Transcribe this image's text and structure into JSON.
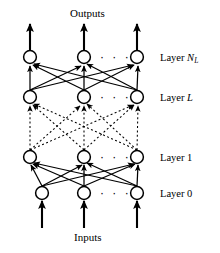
{
  "figure": {
    "title_top": "Outputs",
    "title_bottom": "Inputs",
    "ellipsis": "· · ·",
    "colors": {
      "ink": "#000000",
      "background": "#ffffff"
    }
  },
  "labels": {
    "layer_nl_prefix": "Layer ",
    "layer_nl_symbol": "N",
    "layer_nl_subscript": "L",
    "layer_l_prefix": "Layer ",
    "layer_l_symbol": "L",
    "layer_1": "Layer 1",
    "layer_0": "Layer 0"
  },
  "layers": [
    {
      "id": "layer-nl",
      "name": "Layer N_L",
      "y": 57,
      "nodes_x": [
        30,
        84,
        137
      ]
    },
    {
      "id": "layer-l",
      "name": "Layer L",
      "y": 97,
      "nodes_x": [
        30,
        84,
        137
      ]
    },
    {
      "id": "layer-1",
      "name": "Layer 1",
      "y": 157,
      "nodes_x": [
        30,
        84,
        137
      ]
    },
    {
      "id": "layer-0",
      "name": "Layer 0",
      "y": 193,
      "nodes_x": [
        42,
        84,
        137
      ]
    }
  ],
  "connections": [
    {
      "from": "layer-0",
      "to": "layer-1",
      "style": "solid"
    },
    {
      "from": "layer-1",
      "to": "layer-l",
      "style": "dotted"
    },
    {
      "from": "layer-l",
      "to": "layer-nl",
      "style": "solid"
    }
  ],
  "io_arrows": {
    "outputs": {
      "from_y": 57,
      "to_y": 22,
      "x": [
        30,
        84,
        137
      ]
    },
    "inputs": {
      "from_y": 228,
      "to_y": 197,
      "x": [
        42,
        84,
        137
      ]
    }
  },
  "ellipsis_positions": [
    {
      "layer": "layer-nl",
      "x": 110,
      "y": 57
    },
    {
      "layer": "layer-l",
      "x": 110,
      "y": 97
    },
    {
      "layer": "layer-1",
      "x": 110,
      "y": 157
    },
    {
      "layer": "layer-0",
      "x": 110,
      "y": 193
    }
  ]
}
